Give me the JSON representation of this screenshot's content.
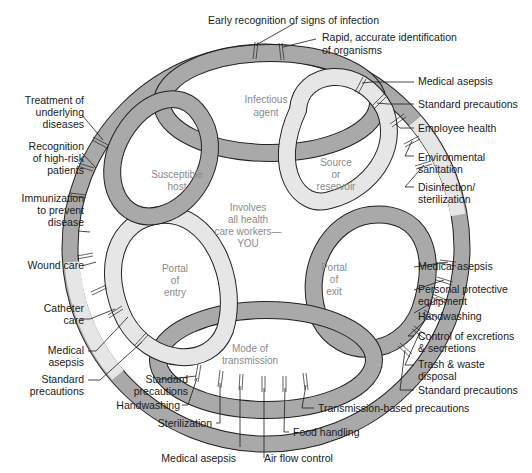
{
  "diagram": {
    "center_text": [
      "Involves",
      "all health",
      "care workers—",
      "YOU"
    ],
    "colors": {
      "dark_loop": "#a9a9a9",
      "light_loop": "#e6e6e6",
      "outline": "#222222",
      "inner_text": "#8a8a8a",
      "label_text": "#1a1a1a"
    },
    "links": [
      {
        "name": "Infectious agent",
        "lines": [
          "Infectious",
          "agent"
        ],
        "shade": "dark",
        "interventions": [
          "Early recognition of signs of infection",
          "Rapid, accurate identification of organisms"
        ]
      },
      {
        "name": "Source or reservoir",
        "lines": [
          "Source",
          "or",
          "reservoir"
        ],
        "shade": "light",
        "interventions": [
          "Medical asepsis",
          "Standard precautions",
          "Employee health",
          "Environmental sanitation",
          "Disinfection/ sterilization"
        ]
      },
      {
        "name": "Portal of exit",
        "lines": [
          "Portal",
          "of",
          "exit"
        ],
        "shade": "dark",
        "interventions": [
          "Medical asepsis",
          "Personal protective equipment",
          "Handwashing",
          "Control of excretions & secretions",
          "Trash & waste disposal",
          "Standard precautions"
        ]
      },
      {
        "name": "Mode of transmission",
        "lines": [
          "Mode of",
          "transmission"
        ],
        "shade": "dark",
        "interventions": [
          "Transmission-based precautions",
          "Food handling",
          "Air flow control",
          "Medical asepsis",
          "Sterilization",
          "Handwashing",
          "Standard precautions"
        ]
      },
      {
        "name": "Portal of entry",
        "lines": [
          "Portal",
          "of",
          "entry"
        ],
        "shade": "light",
        "interventions": [
          "Standard precautions",
          "Medical asepsis",
          "Catheter care",
          "Wound care"
        ]
      },
      {
        "name": "Susceptible host",
        "lines": [
          "Susceptible",
          "host"
        ],
        "shade": "dark",
        "interventions": [
          "Immunization to prevent disease",
          "Recognition of high-risk patients",
          "Treatment of underlying diseases"
        ]
      }
    ],
    "labels": {
      "top_1": "Early recognition of signs of infection",
      "top_2a": "Rapid, accurate identification",
      "top_2b": "of organisms",
      "r1": "Medical asepsis",
      "r2": "Standard precautions",
      "r3": "Employee health",
      "r4a": "Environmental",
      "r4b": "sanitation",
      "r5a": "Disinfection/",
      "r5b": "sterilization",
      "r6": "Medical asepsis",
      "r7a": "Personal protective",
      "r7b": "equipment",
      "r8": "Handwashing",
      "r9a": "Control of excretions",
      "r9b": "& secretions",
      "r10a": "Trash & waste",
      "r10b": "disposal",
      "r11": "Standard precautions",
      "b1": "Transmission-based precautions",
      "b2": "Food handling",
      "b3": "Air flow control",
      "b4": "Medical asepsis",
      "b5": "Sterilization",
      "b6": "Handwashing",
      "b7a": "Standard",
      "b7b": "precautions",
      "l1a": "Standard",
      "l1b": "precautions",
      "l2a": "Medical",
      "l2b": "asepsis",
      "l3a": "Catheter",
      "l3b": "care",
      "l4": "Wound care",
      "l5a": "Immunization",
      "l5b": "to prevent",
      "l5c": "disease",
      "l6a": "Recognition",
      "l6b": "of high-risk",
      "l6c": "patients",
      "l7a": "Treatment of",
      "l7b": "underlying",
      "l7c": "diseases"
    }
  }
}
